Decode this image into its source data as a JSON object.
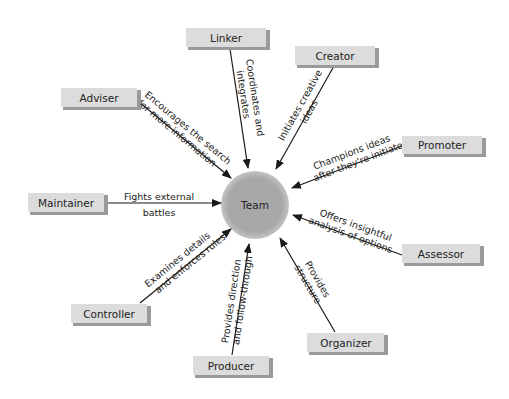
{
  "diagram": {
    "type": "radial-role-diagram",
    "center": {
      "label": "Team",
      "fill": "#a8a8a8"
    },
    "box_fill": "#dcdcdc",
    "roles": [
      {
        "id": "linker",
        "label": "Linker",
        "description_line1": "Coordinates and",
        "description_line2": "integrates"
      },
      {
        "id": "creator",
        "label": "Creator",
        "description_line1": "Initiates creative",
        "description_line2": "ideas"
      },
      {
        "id": "adviser",
        "label": "Adviser",
        "description_line1": "Encourages the search",
        "description_line2": "for more information"
      },
      {
        "id": "promoter",
        "label": "Promoter",
        "description_line1": "Champions ideas",
        "description_line2": "after they're initiated"
      },
      {
        "id": "maintainer",
        "label": "Maintainer",
        "description_line1": "Fights external",
        "description_line2": "battles"
      },
      {
        "id": "assessor",
        "label": "Assessor",
        "description_line1": "Offers insightful",
        "description_line2": "analysis of options"
      },
      {
        "id": "controller",
        "label": "Controller",
        "description_line1": "Examines details",
        "description_line2": "and enforces rules"
      },
      {
        "id": "organizer",
        "label": "Organizer",
        "description_line1": "Provides",
        "description_line2": "structure"
      },
      {
        "id": "producer",
        "label": "Producer",
        "description_line1": "Provides direction",
        "description_line2": "and follow-through"
      }
    ]
  }
}
